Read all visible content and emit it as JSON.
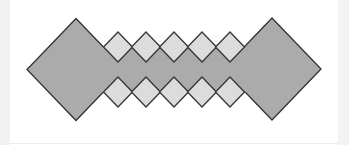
{
  "figure": {
    "colors": {
      "large_fill": "#ababab",
      "band_fill": "#ababab",
      "small_fill": "#dcdcdc",
      "stroke": "#333333",
      "background": "#ffffff",
      "side_strip": "#f1f1f1"
    },
    "large_diamonds": [
      {
        "cx": 76,
        "cy": 69.5,
        "rx": 49,
        "ry": 51
      },
      {
        "cx": 272,
        "cy": 69,
        "rx": 49,
        "ry": 51
      }
    ],
    "band": {
      "x1": 76,
      "x2": 272,
      "y1": 47,
      "y2": 92
    },
    "small_diamond_size": 15,
    "small_rows": [
      {
        "cy": 47,
        "cx": [
          118,
          146,
          174,
          202,
          230
        ]
      },
      {
        "cy": 92,
        "cx": [
          118,
          146,
          174,
          202,
          230
        ]
      }
    ]
  }
}
